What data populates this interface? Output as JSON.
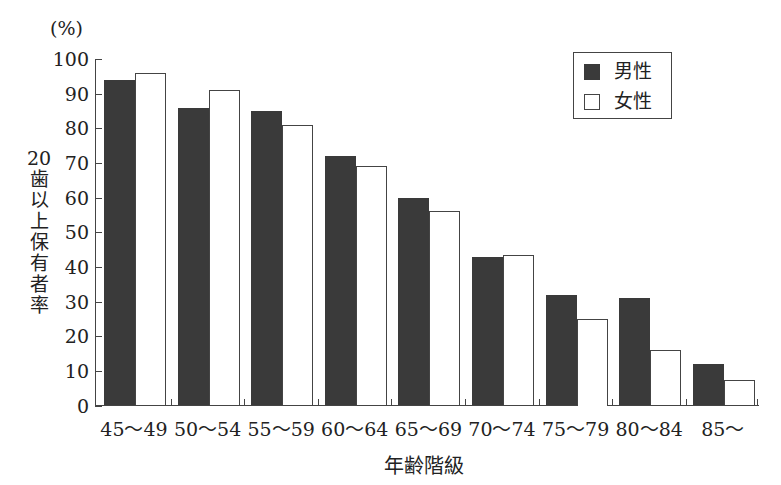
{
  "chart_data": {
    "type": "bar",
    "title": "",
    "xlabel": "年齢階級",
    "ylabel": "20歯以上保有者率",
    "yunit": "(%)",
    "ylim": [
      0,
      100
    ],
    "yticks": [
      0,
      10,
      20,
      30,
      40,
      50,
      60,
      70,
      80,
      90,
      100
    ],
    "grid": false,
    "legend_position": "upper right",
    "categories": [
      "45～49",
      "50～54",
      "55～59",
      "60～64",
      "65～69",
      "70～74",
      "75～79",
      "80～84",
      "85～"
    ],
    "series": [
      {
        "name": "男性",
        "color": "#3a3a3a",
        "values": [
          94,
          86,
          85,
          72,
          60,
          43,
          32,
          31,
          12
        ]
      },
      {
        "name": "女性",
        "color": "#ffffff",
        "values": [
          96,
          91,
          81,
          69,
          56,
          43.5,
          25,
          16,
          7.5
        ]
      }
    ]
  }
}
